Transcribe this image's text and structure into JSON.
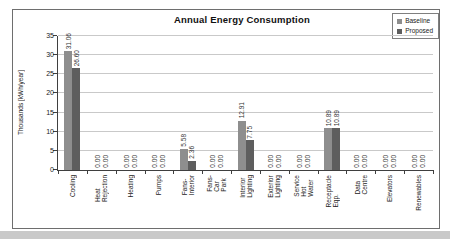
{
  "page": {
    "bottom_edge_color": "#c9c9c9"
  },
  "chart_data": {
    "type": "bar",
    "title": "Annual Energy Consumption",
    "ylabel": "Thousands [kWh/year]",
    "ylim": [
      0,
      35
    ],
    "ytick_step": 5,
    "grid": true,
    "legend_position": "top-right",
    "value_labels_rotated": true,
    "categories": [
      "Cooling",
      "Heat Rejection",
      "Heating",
      "Pumps",
      "Fans-Interior",
      "Fans-Car Park",
      "Interior Lighting",
      "Exterior Lighting",
      "Service Hot\nWater",
      "Receptacle Eqp.",
      "Data Centre",
      "Elevators",
      "Renewables"
    ],
    "series": [
      {
        "name": "Baseline",
        "color": "#8e8e8e",
        "values": [
          31.06,
          0.0,
          0.0,
          0.0,
          5.58,
          0.0,
          12.91,
          0.0,
          0.0,
          10.89,
          0.0,
          0.0,
          0.0
        ]
      },
      {
        "name": "Proposed",
        "color": "#5e5e5e",
        "values": [
          26.6,
          0.0,
          0.0,
          0.0,
          2.36,
          0.0,
          7.75,
          0.0,
          0.0,
          10.89,
          0.0,
          0.0,
          0.0
        ]
      }
    ],
    "colors": {
      "gridline": "#c9c9c9",
      "axis": "#3f3f3f",
      "frame_border": "#6e6e6e"
    }
  }
}
